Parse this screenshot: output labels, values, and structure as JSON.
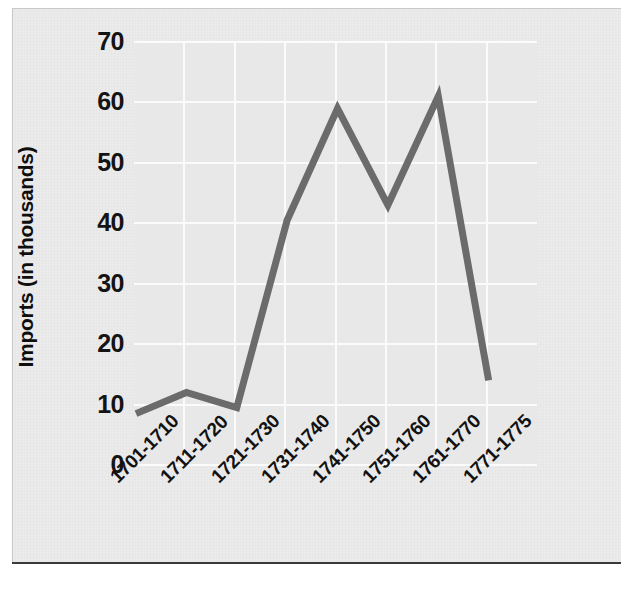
{
  "figure": {
    "background_color": "#ebebeb",
    "plot_background_color": "#e8e8e8",
    "gridline_color": "#fbfbfb",
    "line_color": "#6b6b6b",
    "rule_color": "#3a3a3a"
  },
  "chart_data": {
    "type": "line",
    "title": "",
    "xlabel": "",
    "ylabel": "Imports (in thousands)",
    "categories": [
      "1701-1710",
      "1711-1720",
      "1721-1730",
      "1731-1740",
      "1741-1750",
      "1751-1760",
      "1761-1770",
      "1771-1775"
    ],
    "values": [
      8.5,
      12,
      9.5,
      40.5,
      59,
      43,
      61,
      14
    ],
    "ylim": [
      0,
      70
    ],
    "yticks": [
      0,
      10,
      20,
      30,
      40,
      50,
      60,
      70
    ],
    "ytick_labels": [
      "0",
      "10",
      "20",
      "30",
      "40",
      "50",
      "60",
      "70"
    ],
    "grid": true,
    "legend": "none",
    "series": [
      {
        "name": "Imports",
        "values": [
          8.5,
          12,
          9.5,
          40.5,
          59,
          43,
          61,
          14
        ]
      }
    ]
  }
}
